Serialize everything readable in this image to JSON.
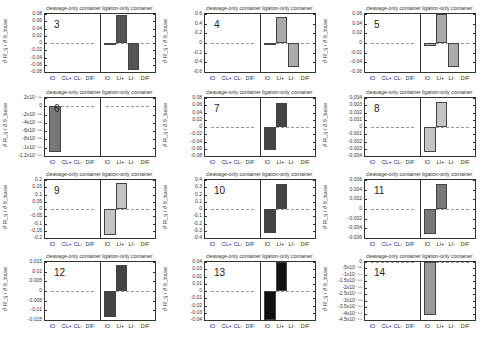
{
  "figure": {
    "ylabel": "∂ R_ij / ∂ θ_base",
    "left_title": "cleavage-only container",
    "right_title": "ligation-only container",
    "left_xticks": [
      "IO",
      "CL+",
      "CL-",
      "DIF"
    ],
    "right_xticks": [
      "IO",
      "LI+",
      "LI-",
      "DIF"
    ]
  },
  "chart_data": [
    {
      "panel": "3",
      "type": "bar",
      "ylim": [
        -0.08,
        0.08
      ],
      "yticks": [
        "0.08",
        "0.06",
        "0.04",
        "0.02",
        "0",
        "-0.02",
        "-0.04",
        "-0.06",
        "-0.08"
      ],
      "categories": [
        "IO",
        "CL+",
        "CL-",
        "DIF",
        "IO",
        "LI+",
        "LI-",
        "DIF"
      ],
      "values": [
        0,
        0,
        0,
        0,
        -0.002,
        0.078,
        -0.074,
        0
      ],
      "bar_color": "#555555"
    },
    {
      "panel": "4",
      "type": "bar",
      "ylim": [
        -0.6,
        0.6
      ],
      "yticks": [
        "0.6",
        "0.4",
        "0.2",
        "0",
        "-0.2",
        "-0.4",
        "-0.6"
      ],
      "categories": [
        "IO",
        "CL+",
        "CL-",
        "DIF",
        "IO",
        "LI+",
        "LI-",
        "DIF"
      ],
      "values": [
        0,
        0,
        0,
        0,
        -0.02,
        0.54,
        -0.5,
        0
      ],
      "bar_color": "#aaaaaa"
    },
    {
      "panel": "5",
      "type": "bar",
      "ylim": [
        -0.06,
        0.06
      ],
      "yticks": [
        "0.06",
        "0.04",
        "0.02",
        "0",
        "-0.02",
        "-0.04",
        "-0.06"
      ],
      "categories": [
        "IO",
        "CL+",
        "CL-",
        "DIF",
        "IO",
        "LI+",
        "LI-",
        "DIF"
      ],
      "values": [
        0,
        0,
        0,
        0,
        -0.006,
        0.06,
        -0.05,
        0
      ],
      "bar_color": "#aaaaaa"
    },
    {
      "panel": "6",
      "type": "bar",
      "ylim": [
        -1.2e-88,
        2e-89
      ],
      "yticks": [
        "2x10⁻⁸⁹",
        "0",
        "-2x10⁻⁸⁹",
        "-4x10⁻⁸⁹",
        "-6x10⁻⁸⁹",
        "-8x10⁻⁸⁹",
        "-1x10⁻⁸⁸",
        "-1.2x10⁻⁸⁸"
      ],
      "categories": [
        "IO",
        "CL+",
        "CL-",
        "DIF",
        "IO",
        "LI+",
        "LI-",
        "DIF"
      ],
      "values": [
        -1.1e-88,
        0,
        0,
        0,
        0,
        0,
        0,
        0
      ],
      "bar_color": "#777777"
    },
    {
      "panel": "7",
      "type": "bar",
      "ylim": [
        -0.08,
        0.08
      ],
      "yticks": [
        "0.08",
        "0.06",
        "0.04",
        "0.02",
        "0",
        "-0.02",
        "-0.04",
        "-0.06",
        "-0.08"
      ],
      "categories": [
        "IO",
        "CL+",
        "CL-",
        "DIF",
        "IO",
        "LI+",
        "LI-",
        "DIF"
      ],
      "values": [
        0,
        0,
        0,
        0,
        -0.064,
        0.066,
        0,
        0
      ],
      "bar_color": "#444444"
    },
    {
      "panel": "8",
      "type": "bar",
      "ylim": [
        -0.004,
        0.004
      ],
      "yticks": [
        "0.004",
        "0.003",
        "0.002",
        "0.001",
        "0",
        "-0.001",
        "-0.002",
        "-0.003",
        "-0.004"
      ],
      "categories": [
        "IO",
        "CL+",
        "CL-",
        "DIF",
        "IO",
        "LI+",
        "LI-",
        "DIF"
      ],
      "values": [
        0,
        0,
        0,
        0,
        -0.0034,
        0.0034,
        0,
        0
      ],
      "bar_color": "#c4c4c4"
    },
    {
      "panel": "9",
      "type": "bar",
      "ylim": [
        -0.2,
        0.2
      ],
      "yticks": [
        "0.2",
        "0.15",
        "0.1",
        "0.05",
        "0",
        "-0.05",
        "-0.1",
        "-0.15",
        "-0.2"
      ],
      "categories": [
        "IO",
        "CL+",
        "CL-",
        "DIF",
        "IO",
        "LI+",
        "LI-",
        "DIF"
      ],
      "values": [
        0,
        0,
        0,
        0,
        -0.18,
        0.18,
        0,
        0
      ],
      "bar_color": "#c4c4c4"
    },
    {
      "panel": "10",
      "type": "bar",
      "ylim": [
        -0.4,
        0.4
      ],
      "yticks": [
        "0.4",
        "0.3",
        "0.2",
        "0.1",
        "0",
        "-0.1",
        "-0.2",
        "-0.3",
        "-0.4"
      ],
      "categories": [
        "IO",
        "CL+",
        "CL-",
        "DIF",
        "IO",
        "LI+",
        "LI-",
        "DIF"
      ],
      "values": [
        0,
        0,
        0,
        0,
        -0.33,
        0.34,
        0,
        0
      ],
      "bar_color": "#444444"
    },
    {
      "panel": "11",
      "type": "bar",
      "ylim": [
        -0.006,
        0.006
      ],
      "yticks": [
        "0.006",
        "0.004",
        "0.002",
        "0",
        "-0.002",
        "-0.004",
        "-0.006"
      ],
      "categories": [
        "IO",
        "CL+",
        "CL-",
        "DIF",
        "IO",
        "LI+",
        "LI-",
        "DIF"
      ],
      "values": [
        0,
        0,
        0,
        0,
        -0.0052,
        0.0052,
        0,
        0
      ],
      "bar_color": "#777777"
    },
    {
      "panel": "12",
      "type": "bar",
      "ylim": [
        -0.015,
        0.015
      ],
      "yticks": [
        "0.015",
        "0.01",
        "0.005",
        "0",
        "-0.005",
        "-0.01",
        "-0.015"
      ],
      "categories": [
        "IO",
        "CL+",
        "CL-",
        "DIF",
        "IO",
        "LI+",
        "LI-",
        "DIF"
      ],
      "values": [
        0,
        0,
        0,
        0,
        -0.0135,
        0.0135,
        0,
        0
      ],
      "bar_color": "#444444"
    },
    {
      "panel": "13",
      "type": "bar",
      "ylim": [
        -0.04,
        0.04
      ],
      "yticks": [
        "0.04",
        "0.03",
        "0.02",
        "0.01",
        "0",
        "-0.01",
        "-0.02",
        "-0.03",
        "-0.04"
      ],
      "categories": [
        "IO",
        "CL+",
        "CL-",
        "DIF",
        "IO",
        "LI+",
        "LI-",
        "DIF"
      ],
      "values": [
        0,
        0,
        0,
        0,
        -0.04,
        0.04,
        0,
        0
      ],
      "bar_color": "#111111"
    },
    {
      "panel": "14",
      "type": "bar",
      "ylim": [
        -4.5e-88,
        0
      ],
      "yticks": [
        "0",
        "-5x10⁻⁸⁹",
        "-1x10⁻⁸⁸",
        "-1.5x10⁻⁸⁸",
        "-2x10⁻⁸⁸",
        "-2.5x10⁻⁸⁸",
        "-3x10⁻⁸⁸",
        "-3.5x10⁻⁸⁸",
        "-4x10⁻⁸⁸",
        "-4.5x10⁻⁸⁸"
      ],
      "categories": [
        "IO",
        "CL+",
        "CL-",
        "DIF",
        "IO",
        "LI+",
        "LI-",
        "DIF"
      ],
      "values": [
        0,
        0,
        0,
        0,
        -4.1e-88,
        0,
        0,
        0
      ],
      "bar_color": "#999999"
    }
  ]
}
